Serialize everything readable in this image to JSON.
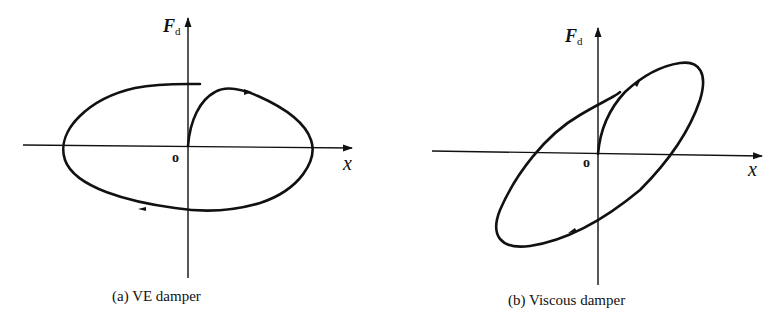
{
  "panels": [
    {
      "id": "a",
      "caption": "(a) VE damper",
      "y_axis_label": "F",
      "y_axis_subscript": "d",
      "x_axis_label": "x",
      "origin_label": "o",
      "curve": "elliptical hysteresis loop, major axis horizontal, starting at origin and circulating clockwise"
    },
    {
      "id": "b",
      "caption": "(b) Viscous damper",
      "y_axis_label": "F",
      "y_axis_subscript": "d",
      "x_axis_label": "x",
      "origin_label": "o",
      "curve": "inclined elliptical hysteresis loop, major axis tilted upward to the right, starting at origin and circulating clockwise"
    }
  ],
  "colors": {
    "line": "#111111",
    "background": "#ffffff"
  }
}
